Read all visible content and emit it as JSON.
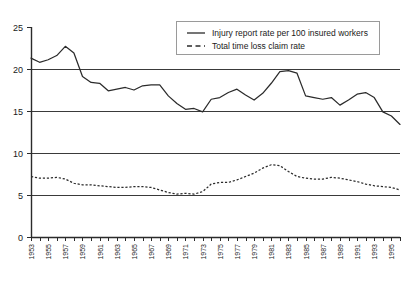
{
  "chart_data": {
    "type": "line",
    "title": "",
    "subtitle": "",
    "xlabel": "",
    "ylabel": "",
    "xlim": [
      1953,
      1996
    ],
    "ylim": [
      0,
      25
    ],
    "yticks": [
      0,
      5,
      10,
      15,
      20,
      25
    ],
    "ytick_labels": [
      "0",
      "5",
      "10",
      "15",
      "20",
      "25"
    ],
    "gridlines": [
      5,
      10,
      15,
      20
    ],
    "grid": true,
    "legend_position": "top-right",
    "x": [
      1953,
      1954,
      1955,
      1956,
      1957,
      1958,
      1959,
      1960,
      1961,
      1962,
      1963,
      1964,
      1965,
      1966,
      1967,
      1968,
      1969,
      1970,
      1971,
      1972,
      1973,
      1974,
      1975,
      1976,
      1977,
      1978,
      1979,
      1980,
      1981,
      1982,
      1983,
      1984,
      1985,
      1986,
      1987,
      1988,
      1989,
      1990,
      1991,
      1992,
      1993,
      1994,
      1995,
      1996
    ],
    "xtick_labels": [
      "1953",
      "1955",
      "1957",
      "1959",
      "1961",
      "1963",
      "1965",
      "1967",
      "1969",
      "1971",
      "1973",
      "1975",
      "1977",
      "1979",
      "1981",
      "1983",
      "1985",
      "1987",
      "1989",
      "1991",
      "1993",
      "1995"
    ],
    "xtick_step_years": 2,
    "minor_tick_step_years": 1,
    "series": [
      {
        "name": "Injury report rate per 100 insured workers",
        "style": "solid",
        "color": "#2b2b2b",
        "values": [
          21.3,
          20.8,
          21.1,
          21.6,
          22.7,
          21.9,
          19.1,
          18.4,
          18.3,
          17.4,
          17.6,
          17.8,
          17.5,
          18.0,
          18.1,
          18.1,
          16.8,
          15.9,
          15.2,
          15.3,
          14.9,
          16.4,
          16.6,
          17.2,
          17.6,
          16.9,
          16.3,
          17.1,
          18.3,
          19.7,
          19.8,
          19.5,
          16.8,
          16.6,
          16.4,
          16.6,
          15.7,
          16.3,
          17.0,
          17.2,
          16.6,
          14.9,
          14.4,
          13.4
        ]
      },
      {
        "name": "Total time loss claim rate",
        "style": "dashed",
        "color": "#2b2b2b",
        "values": [
          7.2,
          7.0,
          7.0,
          7.1,
          6.9,
          6.4,
          6.2,
          6.2,
          6.1,
          6.0,
          5.9,
          5.9,
          6.0,
          6.0,
          5.9,
          5.6,
          5.3,
          5.1,
          5.2,
          5.1,
          5.4,
          6.3,
          6.5,
          6.5,
          6.8,
          7.2,
          7.6,
          8.2,
          8.6,
          8.5,
          7.8,
          7.2,
          7.0,
          6.9,
          6.9,
          7.1,
          7.0,
          6.8,
          6.6,
          6.3,
          6.1,
          6.0,
          5.9,
          5.6
        ]
      }
    ]
  },
  "legend": {
    "items": [
      {
        "label": "Injury report rate per 100 insured workers",
        "style": "solid"
      },
      {
        "label": "Total time loss claim rate",
        "style": "dashed"
      }
    ]
  }
}
